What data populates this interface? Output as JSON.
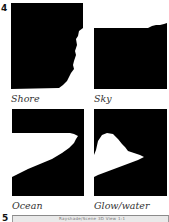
{
  "figure": {
    "number": "4",
    "next_figure_number": "5",
    "panels": [
      {
        "id": "shore",
        "label": "Shore"
      },
      {
        "id": "sky",
        "label": "Sky"
      },
      {
        "id": "ocean",
        "label": "Ocean"
      },
      {
        "id": "glow",
        "label": "Glow/water"
      }
    ],
    "next_figure_strip_text": "Rayshade/Scene 3D View 1:1"
  },
  "colors": {
    "mask_foreground": "#000000",
    "mask_background": "#ffffff",
    "label_text": "#333333"
  }
}
